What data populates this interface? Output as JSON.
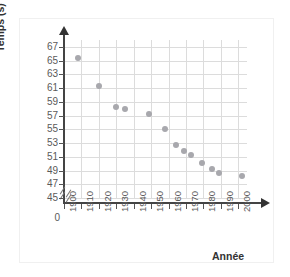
{
  "chart_data": {
    "type": "scatter",
    "title": "",
    "xlabel": "Année",
    "ylabel": "Temps (s)",
    "xlim": [
      1900,
      2005
    ],
    "ylim": [
      45,
      68
    ],
    "grid": true,
    "legend": "none",
    "axis_break": "y-axis break between 0 and 45",
    "x_ticks": [
      "1900",
      "1910",
      "1920",
      "1930",
      "1940",
      "1950",
      "1960",
      "1970",
      "1980",
      "1990",
      "2000"
    ],
    "x_tick_values": [
      1900,
      1910,
      1920,
      1930,
      1940,
      1950,
      1960,
      1970,
      1980,
      1990,
      2000
    ],
    "y_ticks": [
      "67",
      "65",
      "63",
      "61",
      "59",
      "57",
      "55",
      "53",
      "51",
      "49",
      "47",
      "45"
    ],
    "y_tick_values": [
      67,
      65,
      63,
      61,
      59,
      57,
      55,
      53,
      51,
      49,
      47,
      45
    ],
    "origin_label": "0",
    "point_color": "#a8a8ad",
    "grid_color": "#dcdcdc",
    "axis_color": "#444444",
    "points": [
      {
        "x": 1908,
        "y": 65.4
      },
      {
        "x": 1920,
        "y": 61.3
      },
      {
        "x": 1930,
        "y": 58.3
      },
      {
        "x": 1935,
        "y": 58.0
      },
      {
        "x": 1949,
        "y": 57.2
      },
      {
        "x": 1958,
        "y": 55.1
      },
      {
        "x": 1964,
        "y": 52.7
      },
      {
        "x": 1969,
        "y": 51.9
      },
      {
        "x": 1973,
        "y": 51.3
      },
      {
        "x": 1979,
        "y": 50.1
      },
      {
        "x": 1985,
        "y": 49.2
      },
      {
        "x": 1989,
        "y": 48.7
      },
      {
        "x": 2002,
        "y": 48.2
      }
    ]
  }
}
